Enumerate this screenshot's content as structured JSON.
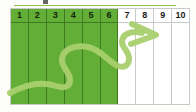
{
  "graphic": {
    "type": "progress-step-tracker",
    "top_rule_color": "#8cc152",
    "filled_color": "#62ae36",
    "empty_color": "#ffffff",
    "border_color": "#c9c9c9",
    "arrow_color_on_green": "#a9d06e",
    "arrow_color_on_white": "#a9d06e",
    "arrow_semantic": "curved-right-arrow",
    "total_steps": 10,
    "completed_steps": 6
  },
  "steps": [
    {
      "label": "1",
      "state": "filled"
    },
    {
      "label": "2",
      "state": "filled"
    },
    {
      "label": "3",
      "state": "filled"
    },
    {
      "label": "4",
      "state": "filled"
    },
    {
      "label": "5",
      "state": "filled"
    },
    {
      "label": "6",
      "state": "filled"
    },
    {
      "label": "7",
      "state": "empty"
    },
    {
      "label": "8",
      "state": "empty"
    },
    {
      "label": "9",
      "state": "empty"
    },
    {
      "label": "10",
      "state": "empty"
    }
  ]
}
